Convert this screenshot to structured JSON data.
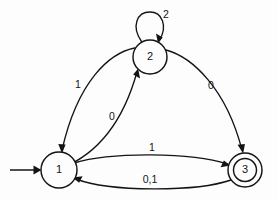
{
  "diagram": {
    "kind": "finite-state-machine",
    "background_color": "#fdfdfd",
    "stroke_color": "#141414",
    "states": [
      {
        "id": "s1",
        "label": "1",
        "cx": 59,
        "cy": 170,
        "r": 18,
        "accepting": false,
        "is_start": true
      },
      {
        "id": "s2",
        "label": "2",
        "cx": 150,
        "cy": 57,
        "r": 17,
        "accepting": false,
        "is_start": false
      },
      {
        "id": "s3",
        "label": "3",
        "cx": 245,
        "cy": 170,
        "r": 17,
        "r_inner": 11,
        "accepting": true,
        "is_start": false
      }
    ],
    "start_arrow": {
      "name": "start-arrow",
      "from_x": 10,
      "to_x": 41,
      "y": 170
    },
    "transitions": [
      {
        "id": "t_2_1",
        "from": "s2",
        "to": "s1",
        "label": "1",
        "label_x": 78,
        "label_y": 85
      },
      {
        "id": "t_1_2",
        "from": "s1",
        "to": "s2",
        "label": "0",
        "label_x": 112,
        "label_y": 117
      },
      {
        "id": "t_2_3",
        "from": "s2",
        "to": "s3",
        "label": "0",
        "label_x": 211,
        "label_y": 86
      },
      {
        "id": "t_1_3",
        "from": "s1",
        "to": "s3",
        "label": "1",
        "label_x": 152,
        "label_y": 148
      },
      {
        "id": "t_3_1",
        "from": "s3",
        "to": "s1",
        "label": "0,1",
        "label_x": 150,
        "label_y": 180
      },
      {
        "id": "t_2_2",
        "from": "s2",
        "to": "s2",
        "label": "2",
        "label_x": 166,
        "label_y": 15,
        "self_loop": true
      }
    ]
  }
}
